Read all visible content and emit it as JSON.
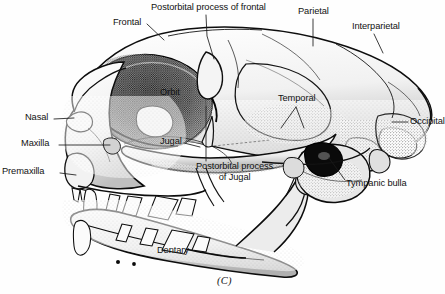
{
  "figure": {
    "caption": "(C)",
    "background_color": "#fefefe",
    "ink_color": "#1a1a1a",
    "label_color": "#121212"
  },
  "labels": [
    {
      "id": "postorbital-process-of-frontal",
      "text": "Postorbital process of frontal",
      "x": 151,
      "y": 3,
      "align": "left",
      "lines": 1
    },
    {
      "id": "frontal",
      "text": "Frontal",
      "x": 113,
      "y": 18,
      "align": "left",
      "lines": 1
    },
    {
      "id": "parietal",
      "text": "Parietal",
      "x": 298,
      "y": 7,
      "align": "left",
      "lines": 1
    },
    {
      "id": "interparietal",
      "text": "Interparietal",
      "x": 352,
      "y": 22,
      "align": "left",
      "lines": 1
    },
    {
      "id": "orbit",
      "text": "Orbit",
      "x": 160,
      "y": 88,
      "align": "left",
      "lines": 1
    },
    {
      "id": "temporal",
      "text": "Temporal",
      "x": 278,
      "y": 94,
      "align": "left",
      "lines": 1
    },
    {
      "id": "nasal",
      "text": "Nasal",
      "x": 25,
      "y": 113,
      "align": "left",
      "lines": 1
    },
    {
      "id": "occipital",
      "text": "Occipital",
      "x": 410,
      "y": 117,
      "align": "left",
      "lines": 1
    },
    {
      "id": "maxilla",
      "text": "Maxilla",
      "x": 21,
      "y": 139,
      "align": "left",
      "lines": 1
    },
    {
      "id": "jugal",
      "text": "Jugal",
      "x": 160,
      "y": 137,
      "align": "left",
      "lines": 1
    },
    {
      "id": "postorbital-process-of-jugal",
      "text": "Postorbital process\nof Jugal",
      "x": 196,
      "y": 162,
      "align": "left",
      "lines": 2
    },
    {
      "id": "premaxilla",
      "text": "Premaxilla",
      "x": 2,
      "y": 167,
      "align": "left",
      "lines": 1
    },
    {
      "id": "tympanic-bulla",
      "text": "Tympanic bulla",
      "x": 346,
      "y": 179,
      "align": "left",
      "lines": 1
    },
    {
      "id": "dentary",
      "text": "Dentary",
      "x": 157,
      "y": 246,
      "align": "left",
      "lines": 1
    }
  ],
  "anatomy": {
    "specimen": "carnivore skull",
    "view": "lateral",
    "structures_labeled": 14
  }
}
